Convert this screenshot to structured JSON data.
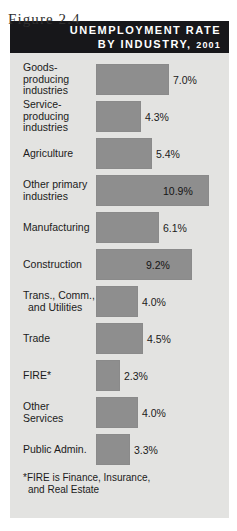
{
  "figure": {
    "caption": "Figure 2.4",
    "title_line_1": "UNEMPLOYMENT RATE",
    "title_line_2": "BY INDUSTRY,",
    "title_year": "2001",
    "footnote_line_1": "*FIRE is Finance, Insurance,",
    "footnote_line_2": "and Real Estate",
    "colors": {
      "title_band": "#17171a",
      "panel_background": "#e3e3e1",
      "bar_fill": "#8e8e8e",
      "text": "#1b1b1b",
      "title_text": "#ffffff"
    }
  },
  "chart_data": {
    "type": "bar",
    "orientation": "horizontal",
    "title": "UNEMPLOYMENT RATE BY INDUSTRY, 2001",
    "xlabel": "",
    "ylabel": "",
    "xlim": [
      0,
      11.5
    ],
    "grid": false,
    "legend": false,
    "unit": "%",
    "categories": [
      "Goods-producing industries",
      "Service-producing industries",
      "Agriculture",
      "Other primary industries",
      "Manufacturing",
      "Construction",
      "Trans., Comm., and Utilities",
      "Trade",
      "FIRE*",
      "Other Services",
      "Public Admin."
    ],
    "values": [
      7.0,
      4.3,
      5.4,
      10.9,
      6.1,
      9.2,
      4.0,
      4.5,
      2.3,
      4.0,
      3.3
    ],
    "data_labels": [
      "7.0%",
      "4.3%",
      "5.4%",
      "10.9%",
      "6.1%",
      "9.2%",
      "4.0%",
      "4.5%",
      "2.3%",
      "4.0%",
      "3.3%"
    ],
    "rows": [
      {
        "label_lines": [
          "Goods-",
          "producing",
          "industries"
        ],
        "value": 7.0,
        "label": "7.0%",
        "label_position": "outside"
      },
      {
        "label_lines": [
          "Service-",
          "producing",
          "industries"
        ],
        "value": 4.3,
        "label": "4.3%",
        "label_position": "outside"
      },
      {
        "label_lines": [
          "Agriculture"
        ],
        "value": 5.4,
        "label": "5.4%",
        "label_position": "outside"
      },
      {
        "label_lines": [
          "Other primary",
          "industries"
        ],
        "value": 10.9,
        "label": "10.9%",
        "label_position": "inside"
      },
      {
        "label_lines": [
          "Manufacturing"
        ],
        "value": 6.1,
        "label": "6.1%",
        "label_position": "outside"
      },
      {
        "label_lines": [
          "Construction"
        ],
        "value": 9.2,
        "label": "9.2%",
        "label_position": "inside"
      },
      {
        "label_lines": [
          "Trans., Comm.,",
          "and Utilities"
        ],
        "value": 4.0,
        "label": "4.0%",
        "label_position": "outside"
      },
      {
        "label_lines": [
          "Trade"
        ],
        "value": 4.5,
        "label": "4.5%",
        "label_position": "outside"
      },
      {
        "label_lines": [
          "FIRE*"
        ],
        "value": 2.3,
        "label": "2.3%",
        "label_position": "outside"
      },
      {
        "label_lines": [
          "Other",
          "Services"
        ],
        "value": 4.0,
        "label": "4.0%",
        "label_position": "outside"
      },
      {
        "label_lines": [
          "Public Admin."
        ],
        "value": 3.3,
        "label": "3.3%",
        "label_position": "outside"
      }
    ]
  }
}
